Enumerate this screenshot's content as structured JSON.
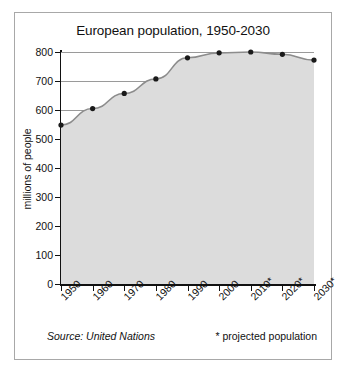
{
  "chart_data": {
    "type": "area",
    "title": "European population, 1950-2030",
    "xlabel": "",
    "ylabel": "millions of people",
    "categories": [
      "1950",
      "1960",
      "1970",
      "1980",
      "1990",
      "2000",
      "2010*",
      "2020*",
      "2030*"
    ],
    "values": [
      548,
      605,
      657,
      707,
      780,
      797,
      800,
      792,
      772
    ],
    "ylim": [
      0,
      800
    ],
    "yticks": [
      "0",
      "100",
      "200",
      "300",
      "400",
      "500",
      "600",
      "700",
      "800"
    ],
    "ytick_values": [
      0,
      100,
      200,
      300,
      400,
      500,
      600,
      700,
      800
    ],
    "grid": true,
    "legend": "none",
    "markers": true,
    "series_name": "European population",
    "colors": {
      "line": "#8c8c8c",
      "marker": "#1a1a1a",
      "area_fill": "#dcdcdc",
      "gridline": "#9a9a9a",
      "axis": "#111111",
      "border": "#a8a8a8",
      "background": "#ffffff"
    }
  },
  "footer": {
    "source": "Source: United Nations",
    "note": "* projected population"
  }
}
